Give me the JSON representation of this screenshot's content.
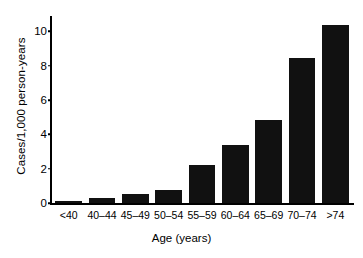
{
  "chart_data": {
    "type": "bar",
    "title": "",
    "xlabel": "Age (years)",
    "ylabel": "Cases/1,000 person-years",
    "categories": [
      "<40",
      "40–44",
      "45–49",
      "50–54",
      "55–59",
      "60–64",
      "65–69",
      "70–74",
      ">74"
    ],
    "values": [
      0.1,
      0.3,
      0.5,
      0.75,
      2.2,
      3.4,
      4.85,
      8.45,
      10.4
    ],
    "ylim": [
      0,
      10.9
    ],
    "yticks": [
      0,
      2,
      4,
      6,
      8,
      10
    ],
    "ytick_labels": [
      "0",
      "2",
      "4",
      "6",
      "8",
      "10"
    ],
    "grid": false,
    "legend": "none",
    "bar_color": "#111111"
  },
  "axes": {
    "y_title": "Cases/1,000 person-years",
    "x_title": "Age (years)"
  }
}
